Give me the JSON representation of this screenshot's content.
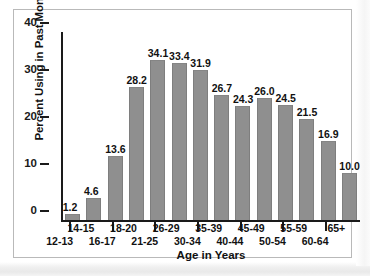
{
  "figure": {
    "frame_border_color": "#b9b9b9",
    "background_color": "#ffffff"
  },
  "chart_data": {
    "type": "bar",
    "title": "",
    "xlabel": "Age in Years",
    "ylabel": "Percent Using in Past Month",
    "categories": [
      "12-13",
      "14-15",
      "16-17",
      "18-20",
      "21-25",
      "26-29",
      "30-34",
      "35-39",
      "40-44",
      "45-49",
      "50-54",
      "55-59",
      "60-64",
      "65+"
    ],
    "values": [
      1.2,
      4.6,
      13.6,
      28.2,
      34.1,
      33.4,
      31.9,
      26.7,
      24.3,
      26.0,
      24.5,
      21.5,
      16.9,
      10.0
    ],
    "value_labels": [
      "1.2",
      "4.6",
      "13.6",
      "28.2",
      "34.1",
      "33.4",
      "31.9",
      "26.7",
      "24.3",
      "26.0",
      "24.5",
      "21.5",
      "16.9",
      "10.0"
    ],
    "ylim": [
      0,
      40
    ],
    "yticks": [
      0,
      10,
      20,
      30,
      40
    ],
    "ytick_labels": [
      "0",
      "10",
      "20",
      "30",
      "40"
    ],
    "grid": false,
    "legend": false,
    "bar_color": "#8f8f8f",
    "axis_color": "#1a1a1a",
    "xlabel_rows": {
      "top_row_categories": [
        "14-15",
        "18-20",
        "26-29",
        "35-39",
        "45-49",
        "55-59",
        "65+"
      ],
      "bottom_row_categories": [
        "12-13",
        "16-17",
        "21-25",
        "30-34",
        "40-44",
        "50-54",
        "60-64"
      ]
    }
  }
}
